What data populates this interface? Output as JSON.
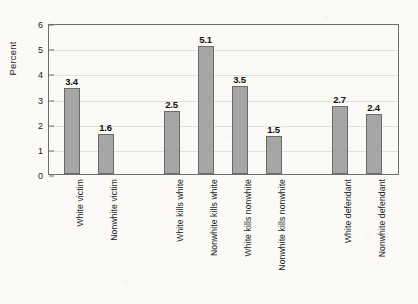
{
  "chart_data": {
    "type": "bar",
    "title": "",
    "subtitle": "",
    "xlabel": "",
    "ylabel": "Percent",
    "ylim": [
      0,
      6
    ],
    "ytick_labels": [
      "0",
      "1",
      "2",
      "3",
      "4",
      "5",
      "6"
    ],
    "ytick_values": [
      0,
      1,
      2,
      3,
      4,
      5,
      6
    ],
    "grid": true,
    "grid_axis": "y",
    "legend": null,
    "legend_position": "none",
    "bar_color": "#a6a6a6",
    "bar_edge_color": "#6a6a6a",
    "frame_color": "#6e6e6e",
    "background_color": "#fbfaf7",
    "text_color": "#1a1a1a",
    "categories": [
      "White victim",
      "Nonwhite victim",
      "White kills white",
      "Nonwhite kills white",
      "White kills nonwhite",
      "Nonwhite kills nonwhite",
      "White defendant",
      "Nonwhite defendant"
    ],
    "values": [
      3.4,
      1.6,
      2.5,
      5.1,
      3.5,
      1.5,
      2.7,
      2.4
    ],
    "value_labels": [
      "3.4",
      "1.6",
      "2.5",
      "5.1",
      "3.5",
      "1.5",
      "2.7",
      "2.4"
    ],
    "groups": [
      {
        "name": "victim",
        "categories": [
          "White victim",
          "Nonwhite victim"
        ]
      },
      {
        "name": "victim-offender-dyad",
        "categories": [
          "White kills white",
          "Nonwhite kills white",
          "White kills nonwhite",
          "Nonwhite kills nonwhite"
        ]
      },
      {
        "name": "defendant",
        "categories": [
          "White defendant",
          "Nonwhite defendant"
        ]
      }
    ],
    "bars": [
      {
        "label": "White victim",
        "value": 3.4,
        "value_label": "3.4",
        "center_x": 70.5
      },
      {
        "label": "Nonwhite victim",
        "value": 1.6,
        "value_label": "1.6",
        "center_x": 104.5
      },
      {
        "label": "White kills white",
        "value": 2.5,
        "value_label": "2.5",
        "center_x": 170.5
      },
      {
        "label": "Nonwhite kills white",
        "value": 5.1,
        "value_label": "5.1",
        "center_x": 204.5
      },
      {
        "label": "White kills nonwhite",
        "value": 3.5,
        "value_label": "3.5",
        "center_x": 238.5
      },
      {
        "label": "Nonwhite kills nonwhite",
        "value": 1.5,
        "value_label": "1.5",
        "center_x": 272.5
      },
      {
        "label": "White defendant",
        "value": 2.7,
        "value_label": "2.7",
        "center_x": 338.5
      },
      {
        "label": "Nonwhite defendant",
        "value": 2.4,
        "value_label": "2.4",
        "center_x": 372.5
      }
    ]
  }
}
